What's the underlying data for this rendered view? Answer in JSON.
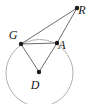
{
  "figure": {
    "width": 93,
    "height": 104,
    "background_color": "#ffffff",
    "stroke_color": "#6b6b6b",
    "circle_stroke_color": "#b0b0b0",
    "point_color": "#1a1a1a",
    "label_color": "#1a1a1a"
  },
  "circle": {
    "name": "circle-D",
    "center_x": 39.5,
    "center_y": 73,
    "radius": 33.5,
    "stroke_width": 1
  },
  "points": [
    {
      "id": "G",
      "label": "G",
      "x": 21,
      "y": 44,
      "label_x": 13,
      "label_y": 39,
      "radius": 2.2
    },
    {
      "id": "A",
      "label": "A",
      "x": 57,
      "y": 43,
      "label_x": 62,
      "label_y": 49,
      "radius": 2.2
    },
    {
      "id": "R",
      "label": "R",
      "x": 77,
      "y": 8,
      "label_x": 82,
      "label_y": 14,
      "radius": 2.2
    },
    {
      "id": "D",
      "label": "D",
      "x": 39,
      "y": 72,
      "label_x": 35,
      "label_y": 89,
      "radius": 2.2
    }
  ],
  "segments": [
    {
      "id": "GR",
      "from": "G",
      "to": "R",
      "x1": 21,
      "y1": 44,
      "x2": 77,
      "y2": 8
    },
    {
      "id": "AR",
      "from": "A",
      "to": "R",
      "x1": 57,
      "y1": 43,
      "x2": 77,
      "y2": 8
    },
    {
      "id": "GA",
      "from": "G",
      "to": "A",
      "x1": 21,
      "y1": 44,
      "x2": 57,
      "y2": 43
    },
    {
      "id": "GD",
      "from": "G",
      "to": "D",
      "x1": 21,
      "y1": 44,
      "x2": 39,
      "y2": 72
    },
    {
      "id": "AD",
      "from": "A",
      "to": "D",
      "x1": 57,
      "y1": 43,
      "x2": 39,
      "y2": 72
    }
  ],
  "labels": {
    "G": "G",
    "A": "A",
    "R": "R",
    "D": "D"
  }
}
